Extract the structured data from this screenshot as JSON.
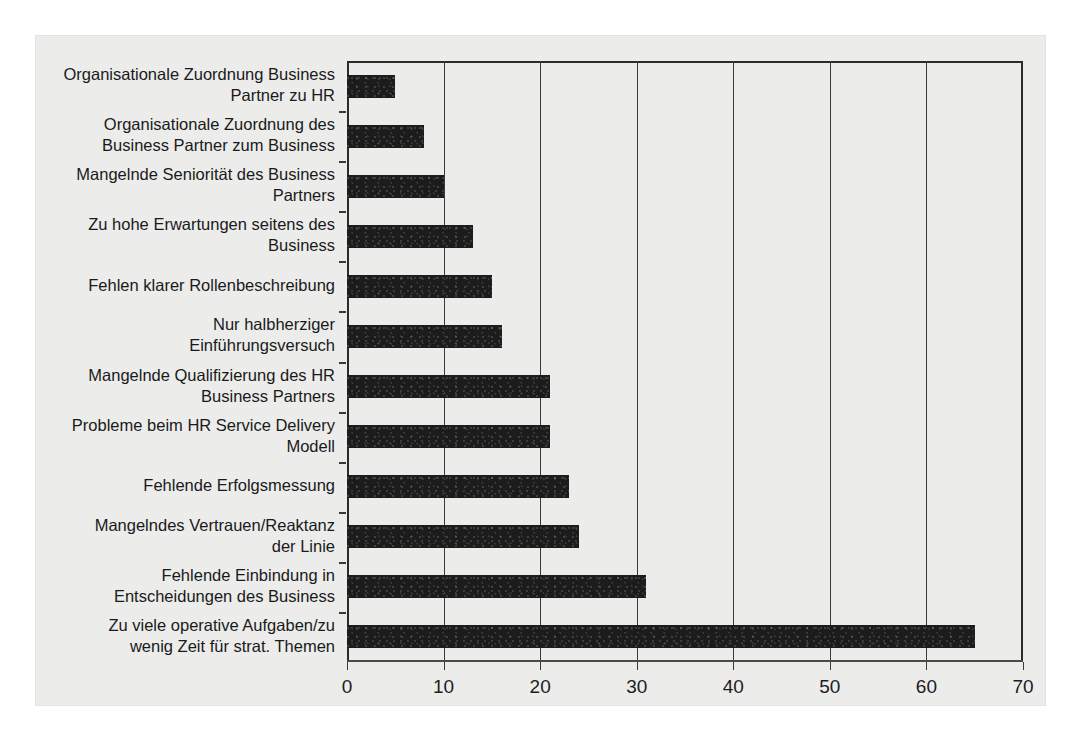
{
  "chart_data": {
    "type": "bar",
    "orientation": "horizontal",
    "title": "",
    "subtitle": "",
    "xlabel": "",
    "ylabel": "",
    "xlim": [
      0,
      70
    ],
    "xticks": [
      "0",
      "10",
      "20",
      "30",
      "40",
      "50",
      "60",
      "70"
    ],
    "xtick_values": [
      0,
      10,
      20,
      30,
      40,
      50,
      60,
      70
    ],
    "grid": "vertical",
    "legend": "none",
    "bar_color": "#1c1c1c",
    "panel_color": "#ececeb",
    "axis_color": "#2b2b2b",
    "categories": [
      "Organisationale Zuordnung Business\nPartner zu HR",
      "Organisationale Zuordnung des\nBusiness Partner zum Business",
      "Mangelnde Seniorität des Business\nPartners",
      "Zu hohe Erwartungen seitens des\nBusiness",
      "Fehlen klarer Rollenbeschreibung",
      "Nur halbherziger\nEinführungsversuch",
      "Mangelnde Qualifizierung des HR\nBusiness Partners",
      "Probleme beim HR Service Delivery\nModell",
      "Fehlende Erfolgsmessung",
      "Mangelndes Vertrauen/Reaktanz\nder Linie",
      "Fehlende Einbindung in\nEntscheidungen des Business",
      "Zu viele operative Aufgaben/zu\nwenig Zeit für strat. Themen"
    ],
    "values": [
      5,
      8,
      10,
      13,
      15,
      16,
      21,
      21,
      23,
      24,
      31,
      65
    ]
  }
}
